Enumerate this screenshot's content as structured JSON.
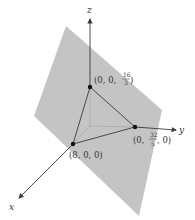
{
  "diagram": {
    "type": "3d-plane-intercepts",
    "colors": {
      "plane": "#c4c4c4",
      "axis": "#3a3a3a",
      "hidden_axis": "#a8a8a8",
      "point": "#111111",
      "background": "#ffffff"
    },
    "axes": {
      "x": {
        "label": "x"
      },
      "y": {
        "label": "y"
      },
      "z": {
        "label": "z"
      }
    },
    "intercepts": {
      "x": {
        "label_open": "(8, 0, 0)",
        "coords": [
          8,
          0,
          0
        ]
      },
      "y": {
        "label_prefix": "(0, ",
        "num": "32",
        "den": "5",
        "label_suffix": ", 0)",
        "coords": [
          "0",
          "32/5",
          "0"
        ]
      },
      "z": {
        "label_prefix": "(0, 0, ",
        "num": "16",
        "den": "3",
        "label_suffix": ")",
        "coords": [
          "0",
          "0",
          "16/3"
        ]
      }
    }
  }
}
